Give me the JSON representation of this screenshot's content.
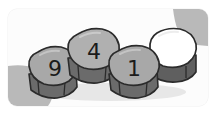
{
  "illustration": {
    "title": "Four numbered stone tiles in a row",
    "subject": "stone-tiles",
    "tile_count": 4,
    "background": {
      "canvas_color": "#fdfdfd",
      "frame_color": "#f2f2f2",
      "corner_shape_color": "#b9b9b9",
      "shadow_color": "#c9c9c9",
      "corner_radius_label": "rounded"
    },
    "palette": {
      "stone_top_fill": "#a8a8a8",
      "stone_top_fill_light": "#b4b4b4",
      "stone_side_fill": "#6f6f6f",
      "stone_side_fill_dark": "#5a5a5a",
      "stone_outline": "#2b2b2b",
      "blank_stone_fill": "#ffffff",
      "digit_color": "#1b1b1b"
    },
    "tiles": [
      {
        "index": 1,
        "label": "9",
        "blank": false,
        "position": "left",
        "fill": "#a8a8a8",
        "center_x": 55,
        "center_y": 70
      },
      {
        "index": 2,
        "label": "4",
        "blank": false,
        "position": "center-left",
        "fill": "#b0b0b0",
        "center_x": 93,
        "center_y": 54
      },
      {
        "index": 3,
        "label": "1",
        "blank": false,
        "position": "center-right",
        "fill": "#a8a8a8",
        "center_x": 133,
        "center_y": 70
      },
      {
        "index": 4,
        "label": "",
        "blank": true,
        "position": "right",
        "fill": "#ffffff",
        "center_x": 173,
        "center_y": 54
      }
    ],
    "sequence_text": "9 4 1"
  }
}
